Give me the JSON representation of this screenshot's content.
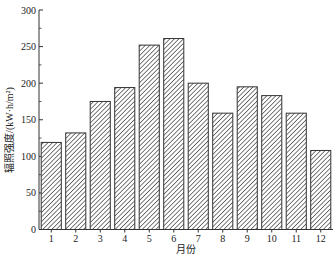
{
  "chart_data": {
    "type": "bar",
    "title": "",
    "xlabel": "月份",
    "ylabel": "辐照强度/(kW·h/m²)",
    "ylim": [
      0,
      300
    ],
    "yticks": [
      0,
      50,
      100,
      150,
      200,
      250,
      300
    ],
    "grid": false,
    "legend": null,
    "categories": [
      "1",
      "2",
      "3",
      "4",
      "5",
      "6",
      "7",
      "8",
      "9",
      "10",
      "11",
      "12"
    ],
    "values": [
      119,
      132,
      175,
      194,
      252,
      261,
      200,
      159,
      195,
      183,
      159,
      108
    ],
    "bar_style": "diagonal-hatch",
    "colors": {
      "bar_fill": "#ffffff",
      "hatch": "#333333",
      "edge": "#333333",
      "axis": "#333333"
    }
  },
  "labels": {
    "xlabel": "月份",
    "ylabel": "辐照强度/(kW·h/m²)"
  }
}
